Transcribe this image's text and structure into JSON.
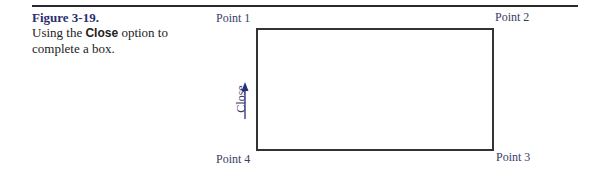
{
  "caption": {
    "title": "Figure 3-19.",
    "text_before": "Using the ",
    "bold": "Close",
    "text_after": " option to complete a box."
  },
  "diagram": {
    "points": {
      "p1": "Point 1",
      "p2": "Point 2",
      "p3": "Point 3",
      "p4": "Point 4"
    },
    "arrow_label": "Close"
  },
  "colors": {
    "title": "#2b2f6e",
    "label": "#3a3d66",
    "arrow": "#2b2f7a"
  }
}
